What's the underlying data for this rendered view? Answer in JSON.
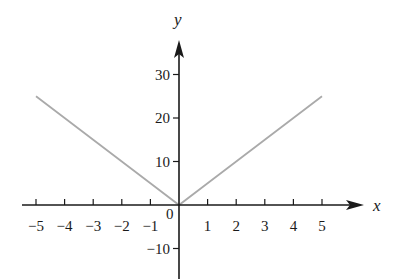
{
  "chart_data": {
    "type": "line",
    "title": "",
    "xlabel": "x",
    "ylabel": "y",
    "xlim": [
      -5,
      5
    ],
    "ylim": [
      -10,
      30
    ],
    "grid": false,
    "legend": null,
    "x_ticks": [
      -5,
      -4,
      -3,
      -2,
      -1,
      1,
      2,
      3,
      4,
      5
    ],
    "x_tick_labels": [
      "−5",
      "−4",
      "−3",
      "−2",
      "−1",
      "1",
      "2",
      "3",
      "4",
      "5"
    ],
    "y_ticks": [
      30,
      20,
      10,
      -10
    ],
    "y_tick_labels": [
      "30",
      "20",
      "10",
      "−10"
    ],
    "origin_label": "0",
    "series": [
      {
        "name": "y = 5|x|",
        "color": "#aaaaaa",
        "x": [
          -5,
          -4,
          -3,
          -2,
          -1,
          0,
          1,
          2,
          3,
          4,
          5
        ],
        "y": [
          25,
          20,
          15,
          10,
          5,
          0,
          5,
          10,
          15,
          20,
          25
        ]
      }
    ]
  },
  "colors": {
    "axis": "#1a1a1a",
    "line": "#aaaaaa",
    "background": "#ffffff"
  }
}
